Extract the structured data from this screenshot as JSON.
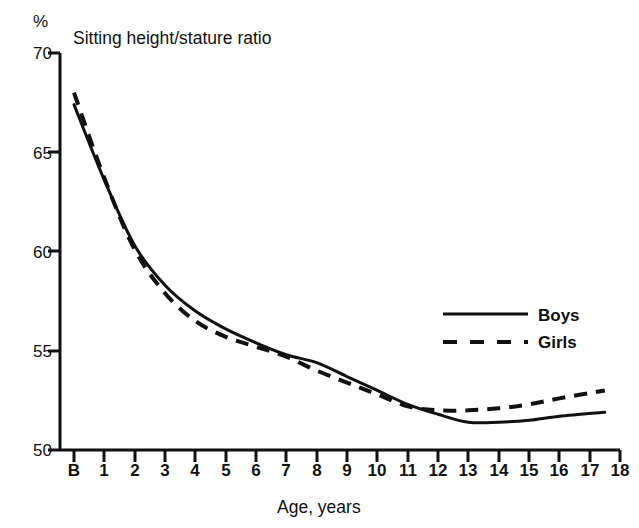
{
  "chart_data": {
    "type": "line",
    "title": "Sitting height/stature ratio",
    "xlabel": "Age, years",
    "ylabel": "%",
    "xlim": [
      0,
      18
    ],
    "ylim": [
      50,
      70
    ],
    "grid": false,
    "legend_position": "inside-right",
    "x_tick_labels": [
      "B",
      "1",
      "2",
      "3",
      "4",
      "5",
      "6",
      "7",
      "8",
      "9",
      "10",
      "11",
      "12",
      "13",
      "14",
      "15",
      "16",
      "17",
      "18"
    ],
    "x": [
      0,
      1,
      2,
      3,
      4,
      5,
      6,
      7,
      8,
      9,
      10,
      11,
      12,
      13,
      14,
      15,
      16,
      17.5
    ],
    "y_tick_labels": [
      "50",
      "55",
      "60",
      "65",
      "70"
    ],
    "y_ticks": [
      50,
      55,
      60,
      65,
      70
    ],
    "series": [
      {
        "name": "Boys",
        "style": "solid",
        "color": "#111111",
        "values": [
          67.4,
          63.6,
          60.3,
          58.3,
          57.0,
          56.1,
          55.4,
          54.8,
          54.4,
          53.7,
          53.0,
          52.3,
          51.8,
          51.4,
          51.4,
          51.5,
          51.7,
          51.9
        ]
      },
      {
        "name": "Girls",
        "style": "dashed",
        "color": "#111111",
        "values": [
          68.0,
          63.7,
          60.1,
          57.9,
          56.5,
          55.7,
          55.2,
          54.7,
          54.0,
          53.4,
          52.8,
          52.2,
          52.0,
          52.0,
          52.1,
          52.3,
          52.6,
          53.0
        ]
      }
    ]
  },
  "legend": {
    "items": [
      {
        "label": "Boys",
        "style": "solid"
      },
      {
        "label": "Girls",
        "style": "dashed"
      }
    ]
  }
}
